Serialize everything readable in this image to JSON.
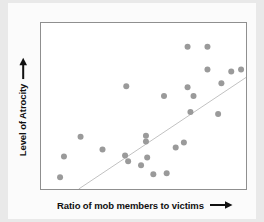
{
  "figure": {
    "background_color": "#e9e9e9",
    "card_color": "#fbfbfb",
    "plot_background": "#ffffff",
    "frame_color": "#8f8f8f"
  },
  "axes": {
    "y_label": "Level of Atrocity",
    "y_arrow_icon": "arrow-up-icon",
    "x_label": "Ratio of mob members to victims",
    "x_arrow_icon": "arrow-right-icon"
  },
  "chart_data": {
    "type": "scatter",
    "title": "",
    "xlabel": "Ratio of mob members to victims",
    "ylabel": "Level of Atrocity",
    "xlim": [
      0,
      1
    ],
    "ylim": [
      0,
      1
    ],
    "grid": false,
    "legend": false,
    "axis_ticks": "none",
    "marker_color": "#9a9a9a",
    "marker_radius": 3,
    "note": "Conceptual scatter plot with unlabeled axes showing a positive correlation; values are normalized 0-1 fractions of the plot frame.",
    "points": [
      {
        "x": 0.112,
        "y": 0.196
      },
      {
        "x": 0.093,
        "y": 0.071
      },
      {
        "x": 0.193,
        "y": 0.315
      },
      {
        "x": 0.3,
        "y": 0.238
      },
      {
        "x": 0.416,
        "y": 0.619
      },
      {
        "x": 0.41,
        "y": 0.202
      },
      {
        "x": 0.425,
        "y": 0.167
      },
      {
        "x": 0.488,
        "y": 0.143
      },
      {
        "x": 0.512,
        "y": 0.286
      },
      {
        "x": 0.512,
        "y": 0.321
      },
      {
        "x": 0.518,
        "y": 0.19
      },
      {
        "x": 0.548,
        "y": 0.089
      },
      {
        "x": 0.613,
        "y": 0.095
      },
      {
        "x": 0.657,
        "y": 0.25
      },
      {
        "x": 0.697,
        "y": 0.28
      },
      {
        "x": 0.715,
        "y": 0.857
      },
      {
        "x": 0.715,
        "y": 0.613
      },
      {
        "x": 0.729,
        "y": 0.464
      },
      {
        "x": 0.744,
        "y": 0.56
      },
      {
        "x": 0.812,
        "y": 0.857
      },
      {
        "x": 0.812,
        "y": 0.72
      },
      {
        "x": 0.864,
        "y": 0.452
      },
      {
        "x": 0.88,
        "y": 0.637
      },
      {
        "x": 0.928,
        "y": 0.708
      },
      {
        "x": 0.976,
        "y": 0.72
      },
      {
        "x": 0.6,
        "y": 0.56
      }
    ],
    "trendline": {
      "visible": true,
      "color": "#c2c2c2",
      "start": {
        "x": 0.184,
        "y": 0.0
      },
      "end": {
        "x": 1.0,
        "y": 0.672
      }
    }
  }
}
